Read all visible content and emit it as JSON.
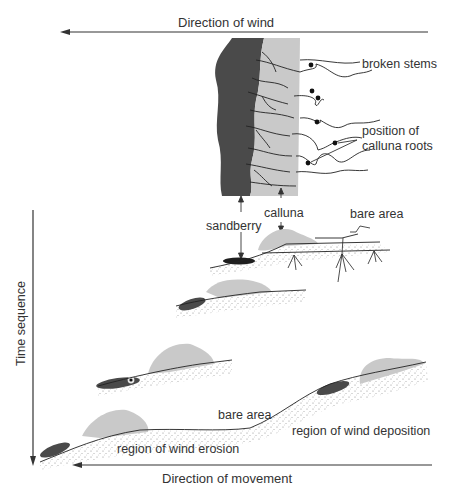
{
  "diagram": {
    "type": "process",
    "title": "",
    "arrows": {
      "wind": "Direction  of wind",
      "time": "Time sequence",
      "movement": "Direction of movement"
    },
    "detail_labels": {
      "broken_stems": "broken stems",
      "roots_line1": "position of",
      "roots_line2": "calluna roots",
      "sandberry": "sandberry",
      "calluna": "calluna",
      "bare_area_top": "bare area"
    },
    "sequence_labels": {
      "bare_area": "bare area",
      "erosion": "region of wind erosion",
      "deposition": "region of wind  deposition"
    },
    "stages": [
      {
        "name": "plan view of patch edge",
        "elements": [
          "sandberry",
          "calluna",
          "broken stems",
          "calluna roots"
        ]
      },
      {
        "name": "stage 1 section",
        "elements": [
          "sandberry",
          "calluna",
          "bare area",
          "roots"
        ]
      },
      {
        "name": "stage 2 section",
        "elements": [
          "sandberry",
          "calluna"
        ]
      },
      {
        "name": "stage 3 section",
        "elements": [
          "sandberry",
          "calluna"
        ]
      },
      {
        "name": "stage 4 section",
        "elements": [
          "sandberry",
          "calluna",
          "bare area",
          "region of wind erosion",
          "region of wind deposition"
        ]
      }
    ],
    "colors": {
      "sandberry": "#4a4a4a",
      "calluna": "#c9c9c9",
      "line": "#2a2a2a",
      "stipple": "#8a8a8a"
    }
  }
}
